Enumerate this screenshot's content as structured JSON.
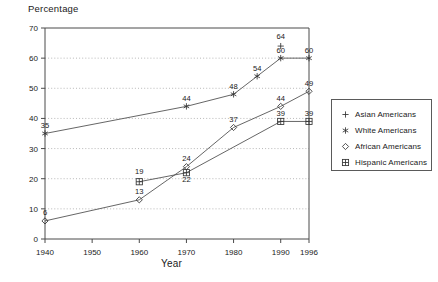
{
  "chart_data": {
    "type": "line",
    "title": "",
    "xlabel": "Year",
    "ylabel": "Percentage",
    "x": [
      1940,
      1950,
      1960,
      1970,
      1980,
      1990,
      1996
    ],
    "xtick_labels": [
      "1940",
      "1950",
      "1960",
      "1970",
      "1980",
      "1990",
      "1996"
    ],
    "ytick_labels": [
      "0",
      "10",
      "20",
      "30",
      "40",
      "50",
      "60",
      "70"
    ],
    "ylim": [
      0,
      70
    ],
    "ytick_step": 10,
    "grid": "horizontal-dotted",
    "legend_position": "right",
    "series": [
      {
        "name": "Asian Americans",
        "marker": "plus",
        "points": [
          {
            "x": 1990,
            "y": 64,
            "label": "64"
          }
        ]
      },
      {
        "name": "White Americans",
        "marker": "asterisk",
        "points": [
          {
            "x": 1940,
            "y": 35,
            "label": "35"
          },
          {
            "x": 1970,
            "y": 44,
            "label": "44"
          },
          {
            "x": 1980,
            "y": 48,
            "label": "48"
          },
          {
            "x": 1985,
            "y": 54,
            "label": "54"
          },
          {
            "x": 1990,
            "y": 60,
            "label": "60"
          },
          {
            "x": 1996,
            "y": 60,
            "label": "60"
          }
        ]
      },
      {
        "name": "African Americans",
        "marker": "diamond",
        "points": [
          {
            "x": 1940,
            "y": 6,
            "label": "6"
          },
          {
            "x": 1960,
            "y": 13,
            "label": "13"
          },
          {
            "x": 1970,
            "y": 24,
            "label": "24"
          },
          {
            "x": 1980,
            "y": 37,
            "label": "37"
          },
          {
            "x": 1990,
            "y": 44,
            "label": "44"
          },
          {
            "x": 1996,
            "y": 49,
            "label": "49"
          }
        ]
      },
      {
        "name": "Hispanic Americans",
        "marker": "boxed-plus",
        "points": [
          {
            "x": 1960,
            "y": 19,
            "label": "19"
          },
          {
            "x": 1970,
            "y": 22,
            "label": "22"
          },
          {
            "x": 1990,
            "y": 39,
            "label": "39"
          },
          {
            "x": 1996,
            "y": 39,
            "label": "39"
          }
        ]
      }
    ]
  },
  "axes": {
    "y_title": "Percentage",
    "x_title": "Year"
  },
  "legend": {
    "items": [
      {
        "label": "Asian Americans",
        "marker": "plus-icon"
      },
      {
        "label": "White Americans",
        "marker": "asterisk-icon"
      },
      {
        "label": "African Americans",
        "marker": "diamond-icon"
      },
      {
        "label": "Hispanic Americans",
        "marker": "boxed-plus-icon"
      }
    ]
  }
}
